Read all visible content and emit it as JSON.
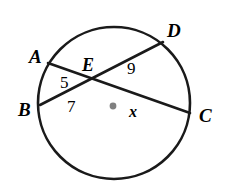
{
  "figure": {
    "type": "circle-geometry-diagram",
    "stroke_color": "#1a1a1a",
    "center_dot_color": "#808080",
    "background_color": "#ffffff"
  },
  "circle": {
    "center_x": 114,
    "center_y": 103,
    "radius": 76
  },
  "center_point": {
    "x": 113,
    "y": 106
  },
  "vertices": {
    "A": {
      "label": "A",
      "x": 48,
      "y": 63
    },
    "B": {
      "label": "B",
      "x": 40,
      "y": 105
    },
    "C": {
      "label": "C",
      "x": 190,
      "y": 113
    },
    "D": {
      "label": "D",
      "x": 163,
      "y": 42
    },
    "E": {
      "label": "E",
      "x": 92,
      "y": 81
    }
  },
  "chords": [
    {
      "name": "chord-AC",
      "from": "A",
      "to": "C",
      "x1": 48,
      "y1": 63,
      "x2": 190,
      "y2": 113
    },
    {
      "name": "chord-BD",
      "from": "B",
      "to": "D",
      "x1": 40,
      "y1": 105,
      "x2": 163,
      "y2": 42
    }
  ],
  "measures": {
    "AE": "5",
    "ED": "9",
    "BE": "7",
    "EC": "x"
  }
}
